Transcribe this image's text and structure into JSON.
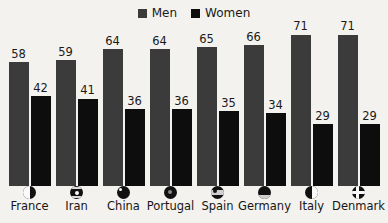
{
  "chart_data": {
    "type": "bar",
    "title": "",
    "xlabel": "",
    "ylabel": "",
    "ylim": [
      0,
      75
    ],
    "grid": false,
    "legend_position": "top-center",
    "categories": [
      "France",
      "Iran",
      "China",
      "Portugal",
      "Spain",
      "Germany",
      "Italy",
      "Denmark"
    ],
    "series": [
      {
        "name": "Men",
        "color": "#3b3b3b",
        "values": [
          58,
          59,
          64,
          64,
          65,
          66,
          71,
          71
        ]
      },
      {
        "name": "Women",
        "color": "#0d0d0d",
        "values": [
          42,
          41,
          36,
          36,
          35,
          34,
          29,
          29
        ]
      }
    ]
  },
  "legend": {
    "items": [
      {
        "label": "Men",
        "color": "#3b3b3b",
        "icon": "square-swatch-icon"
      },
      {
        "label": "Women",
        "color": "#0d0d0d",
        "icon": "square-swatch-icon"
      }
    ]
  },
  "axis": {
    "ticks": [
      {
        "label": "France",
        "flag_icon": "flag-france-icon"
      },
      {
        "label": "Iran",
        "flag_icon": "flag-iran-icon"
      },
      {
        "label": "China",
        "flag_icon": "flag-china-icon"
      },
      {
        "label": "Portugal",
        "flag_icon": "flag-portugal-icon"
      },
      {
        "label": "Spain",
        "flag_icon": "flag-spain-icon"
      },
      {
        "label": "Germany",
        "flag_icon": "flag-germany-icon"
      },
      {
        "label": "Italy",
        "flag_icon": "flag-italy-icon"
      },
      {
        "label": "Denmark",
        "flag_icon": "flag-denmark-icon"
      }
    ]
  },
  "colors": {
    "background": "#f4f2ee",
    "men": "#3b3b3b",
    "women": "#0d0d0d",
    "text": "#1a1a1a"
  }
}
